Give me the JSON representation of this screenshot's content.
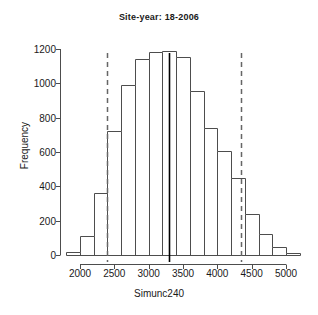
{
  "plot": {
    "title": "Site-year: 18-2006",
    "xlabel": "Simunc240",
    "ylabel": "Frequency"
  },
  "axes": {
    "y_ticks": [
      "0",
      "200",
      "400",
      "600",
      "800",
      "1000",
      "1200"
    ],
    "x_ticks": [
      "2000",
      "2500",
      "3000",
      "3500",
      "4000",
      "4500",
      "5000"
    ]
  },
  "chart_data": {
    "type": "bar",
    "title": "Site-year: 18-2006",
    "xlabel": "Simunc240",
    "ylabel": "Frequency",
    "bin_width": 200,
    "bin_edges": [
      1800,
      2000,
      2200,
      2400,
      2600,
      2800,
      3000,
      3200,
      3400,
      3600,
      3800,
      4000,
      4200,
      4400,
      4600,
      4800,
      5000,
      5200
    ],
    "bin_centers": [
      1900,
      2100,
      2300,
      2500,
      2700,
      2900,
      3100,
      3300,
      3500,
      3700,
      3900,
      4100,
      4300,
      4500,
      4700,
      4900,
      5100
    ],
    "values": [
      20,
      110,
      360,
      720,
      990,
      1140,
      1180,
      1190,
      1155,
      955,
      740,
      605,
      450,
      240,
      125,
      45,
      10
    ],
    "xlim": [
      1750,
      5250
    ],
    "ylim": [
      0,
      1250
    ],
    "y_ticks": [
      0,
      200,
      400,
      600,
      800,
      1000,
      1200
    ],
    "x_ticks": [
      2000,
      2500,
      3000,
      3500,
      4000,
      4500,
      5000
    ],
    "grid": false,
    "legend": null,
    "bar_fill": "#ffffff",
    "bar_stroke": "#4d4d4d",
    "annotations": [
      {
        "name": "lower-reference-line",
        "type": "vline",
        "x": 2400,
        "style": "dashed",
        "color": "#666666"
      },
      {
        "name": "observed-value-line",
        "type": "vline",
        "x": 3300,
        "style": "solid",
        "color": "#000000"
      },
      {
        "name": "upper-reference-line",
        "type": "vline",
        "x": 4350,
        "style": "dashed",
        "color": "#666666"
      }
    ]
  }
}
